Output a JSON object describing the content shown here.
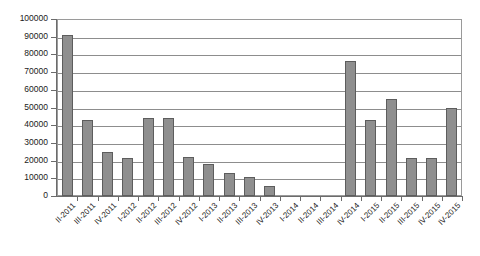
{
  "chart_data": {
    "type": "bar",
    "title": "",
    "subtitle": "",
    "xlabel": "",
    "ylabel": "",
    "ylim": [
      0,
      100000
    ],
    "ytick_step": 10000,
    "grid": true,
    "legend": false,
    "legend_position": "none",
    "bar_color": "#8f8f8f",
    "bar_border_color": "#5d5d5d",
    "gridline_color": "#8d8d8d",
    "axis_color": "#6b6b6b",
    "background_color": "#ffffff",
    "yticks": [
      "0",
      "10000",
      "20000",
      "30000",
      "40000",
      "50000",
      "60000",
      "70000",
      "80000",
      "90000",
      "100000"
    ],
    "categories": [
      "II-2011",
      "III-2011",
      "IV-2011",
      "I-2012",
      "II-2012",
      "III-2012",
      "IV-2012",
      "I-2013",
      "II-2013",
      "III-2013",
      "IV-2013",
      "I-2014",
      "II-2014",
      "III-2014",
      "IV-2014",
      "I-2015",
      "II-2015",
      "III-2015",
      "IV-2015"
    ],
    "values": [
      91000,
      43000,
      25000,
      21500,
      44000,
      44000,
      22000,
      18000,
      13000,
      10500,
      5500,
      0,
      0,
      0,
      76000,
      43000,
      55000,
      21500,
      21500
    ],
    "series": [
      {
        "name": "Series 1",
        "values": [
          91000,
          43000,
          25000,
          21500,
          44000,
          44000,
          22000,
          18000,
          13000,
          10500,
          5500,
          0,
          0,
          0,
          76000,
          43000,
          55000,
          21500,
          21500
        ]
      }
    ],
    "extra_trailing_value": 50000,
    "extra_trailing_label": "IV-2015"
  }
}
